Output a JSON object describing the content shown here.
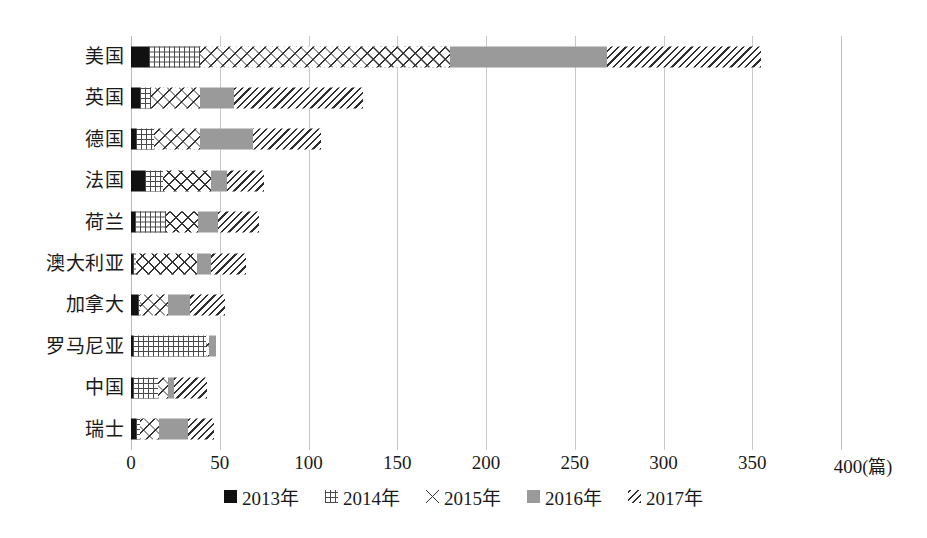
{
  "chart_data": {
    "type": "bar",
    "orientation": "horizontal",
    "stacked": true,
    "title": "",
    "xlabel": "(篇)",
    "ylabel": "",
    "xlim": [
      0,
      400
    ],
    "xticks": [
      0,
      50,
      100,
      150,
      200,
      250,
      300,
      350,
      400
    ],
    "xtick_labels": [
      "0",
      "50",
      "100",
      "150",
      "200",
      "250",
      "300",
      "350",
      "400"
    ],
    "unit_label": "(篇)",
    "grid": true,
    "grid_axis": "x",
    "legend_position": "bottom",
    "categories": [
      "美国",
      "英国",
      "德国",
      "法国",
      "荷兰",
      "澳大利亚",
      "加拿大",
      "罗马尼亚",
      "中国",
      "瑞士"
    ],
    "series": [
      {
        "name": "2013年",
        "pattern": "solid-black",
        "color": "#111111",
        "values": [
          10,
          5,
          3,
          8,
          2,
          1,
          4,
          1,
          1,
          3
        ]
      },
      {
        "name": "2014年",
        "pattern": "grid",
        "color": "#4a4a4a",
        "values": [
          29,
          6,
          10,
          10,
          18,
          2,
          1,
          41,
          14,
          2
        ]
      },
      {
        "name": "2015年",
        "pattern": "cross-diamond",
        "color": "#333333",
        "values": [
          141,
          28,
          26,
          27,
          18,
          34,
          16,
          2,
          6,
          11
        ]
      },
      {
        "name": "2016年",
        "pattern": "solid-gray",
        "color": "#9a9a9a",
        "values": [
          88,
          19,
          30,
          9,
          11,
          8,
          12,
          4,
          3,
          16
        ]
      },
      {
        "name": "2017年",
        "pattern": "diagonal-hatch",
        "color": "#2e2e2e",
        "values": [
          87,
          73,
          38,
          21,
          23,
          20,
          20,
          0,
          19,
          15
        ]
      }
    ],
    "totals": [
      355,
      131,
      107,
      75,
      72,
      65,
      53,
      48,
      43,
      47
    ]
  },
  "legend": {
    "items": [
      {
        "label": "2013年",
        "pattern": "solid-black"
      },
      {
        "label": "2014年",
        "pattern": "grid"
      },
      {
        "label": "2015年",
        "pattern": "cross-diamond"
      },
      {
        "label": "2016年",
        "pattern": "solid-gray"
      },
      {
        "label": "2017年",
        "pattern": "diagonal-hatch"
      }
    ]
  },
  "colors": {
    "series_2013": "#111111",
    "series_2014": "#4a4a4a",
    "series_2015": "#333333",
    "series_2016": "#9a9a9a",
    "series_2017": "#2e2e2e",
    "gridline": "#c8c8c8",
    "background": "#ffffff",
    "text": "#1a1a1a"
  }
}
